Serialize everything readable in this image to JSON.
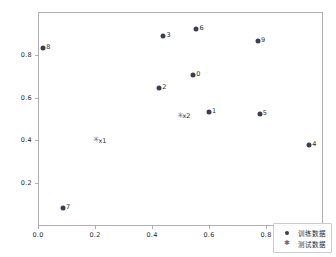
{
  "chart_data": {
    "type": "scatter",
    "title": "",
    "xlabel": "",
    "ylabel": "",
    "xlim": [
      0.0,
      1.0
    ],
    "ylim": [
      0.0,
      1.0
    ],
    "grid": false,
    "legend_position": "lower right",
    "xticks": [
      "0.0",
      "0.2",
      "0.4",
      "0.6",
      "0.8",
      "1.0"
    ],
    "xtick_values": [
      0.0,
      0.2,
      0.4,
      0.6,
      0.8,
      1.0
    ],
    "yticks": [
      "0.2",
      "0.4",
      "0.6",
      "0.8"
    ],
    "ytick_values": [
      0.2,
      0.4,
      0.6,
      0.8
    ],
    "series": [
      {
        "name": "训练数据",
        "marker": "circle",
        "color": "#3d3d54",
        "points": [
          {
            "label": "0",
            "x": 0.545,
            "y": 0.705
          },
          {
            "label": "1",
            "x": 0.6,
            "y": 0.535
          },
          {
            "label": "2",
            "x": 0.425,
            "y": 0.645
          },
          {
            "label": "3",
            "x": 0.44,
            "y": 0.89
          },
          {
            "label": "4",
            "x": 0.952,
            "y": 0.38
          },
          {
            "label": "5",
            "x": 0.778,
            "y": 0.525
          },
          {
            "label": "6",
            "x": 0.556,
            "y": 0.92
          },
          {
            "label": "7",
            "x": 0.088,
            "y": 0.085
          },
          {
            "label": "8",
            "x": 0.018,
            "y": 0.83
          },
          {
            "label": "9",
            "x": 0.772,
            "y": 0.865
          }
        ]
      },
      {
        "name": "测试数据",
        "marker": "star",
        "color": "#6a6a82",
        "points": [
          {
            "label": "x1",
            "x": 0.205,
            "y": 0.4
          },
          {
            "label": "x2",
            "x": 0.5,
            "y": 0.515
          }
        ]
      }
    ]
  },
  "legend": {
    "entries": [
      {
        "label": "训练数据",
        "marker": "circle-marker"
      },
      {
        "label": "测试数据",
        "marker": "star-marker"
      }
    ]
  }
}
